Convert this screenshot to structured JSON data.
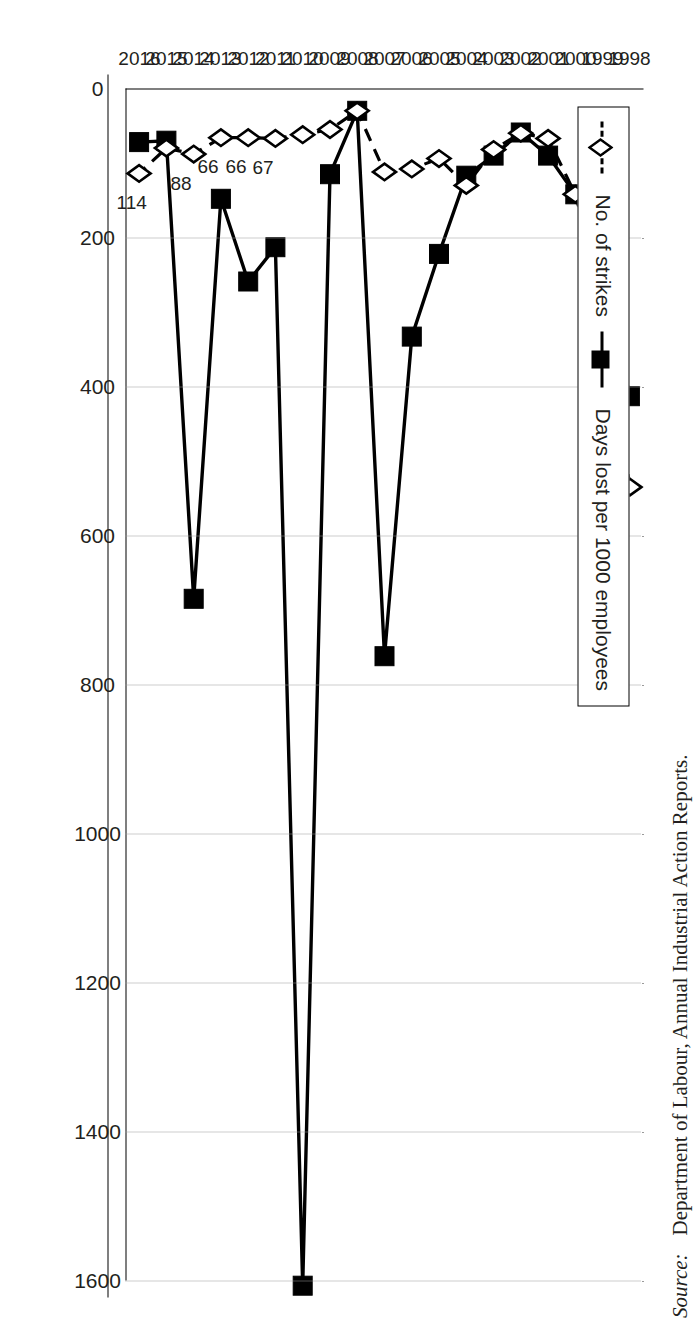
{
  "figure": {
    "source_prefix": "Source:",
    "source_text": "Department of Labour, Annual Industrial Action Reports."
  },
  "legend": {
    "entries": [
      {
        "label": "No. of strikes",
        "marker": "open-diamond",
        "line": "dashed",
        "color": "#000000"
      },
      {
        "label": "Days lost per 1000 employees",
        "marker": "filled-square",
        "line": "solid",
        "color": "#000000"
      }
    ]
  },
  "chart_data": {
    "type": "line",
    "title": "",
    "xlabel": "",
    "ylabel": "",
    "ylim": [
      0,
      1600
    ],
    "yticks": [
      0,
      200,
      400,
      600,
      800,
      1000,
      1200,
      1400,
      1600
    ],
    "ytick_labels": [
      "0",
      "200",
      "400",
      "600",
      "800",
      "1000",
      "1200",
      "1400",
      "1600"
    ],
    "grid": true,
    "grid_axis": "y",
    "legend_position": "top-left",
    "orientation": "rotated-90-clockwise",
    "categories": [
      "1998",
      "1999",
      "2000",
      "2001",
      "2002",
      "2003",
      "2004",
      "2005",
      "2006",
      "2007",
      "2008",
      "2009",
      "2010",
      "2011",
      "2012",
      "2013",
      "2014",
      "2015",
      "2016"
    ],
    "series": [
      {
        "name": "Days lost per 1000 employees",
        "marker": "filled-square",
        "line": "solid",
        "values": [
          413,
          253,
          142,
          90,
          59,
          90,
          117,
          222,
          333,
          762,
          30,
          115,
          1607,
          213,
          259,
          148,
          685,
          70,
          72
        ]
      },
      {
        "name": "No. of strikes",
        "marker": "open-diamond",
        "line": "dashed",
        "values": [
          535,
          280,
          142,
          67,
          60,
          82,
          130,
          94,
          108,
          112,
          30,
          55,
          62,
          67,
          66,
          66,
          88,
          80,
          114
        ],
        "point_labels": {
          "2011": "67",
          "2012": "66",
          "2013": "66",
          "2014": "88",
          "2016": "114"
        }
      }
    ]
  }
}
